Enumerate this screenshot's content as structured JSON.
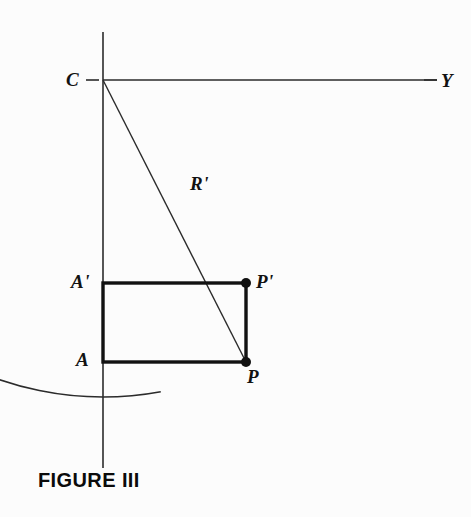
{
  "figure": {
    "caption": "FIGURE III",
    "caption_pos": {
      "x": 38,
      "y": 470
    },
    "background_color": "#fcfcfc",
    "ink_color": "#111111",
    "thin_stroke_color": "#2b2b2b"
  },
  "labels": [
    {
      "id": "center-label",
      "text": "C",
      "x": 66,
      "y": 70,
      "name": "label-c"
    },
    {
      "id": "y-label",
      "text": "Y",
      "x": 441,
      "y": 71,
      "name": "label-y"
    },
    {
      "id": "radius-label",
      "text": "R'",
      "x": 190,
      "y": 174,
      "name": "label-r-prime"
    },
    {
      "id": "a-prime-label",
      "text": "A'",
      "x": 71,
      "y": 272,
      "name": "label-a-prime"
    },
    {
      "id": "p-prime-label",
      "text": "P'",
      "x": 256,
      "y": 272,
      "name": "label-p-prime"
    },
    {
      "id": "a-label",
      "text": "A",
      "x": 76,
      "y": 350,
      "name": "label-a"
    },
    {
      "id": "p-label",
      "text": "P",
      "x": 247,
      "y": 367,
      "name": "label-p"
    }
  ],
  "geometry": {
    "vertical_axis": {
      "x": 103,
      "y1": 32,
      "y2": 468
    },
    "horizontal_axis": {
      "y": 80,
      "x1": 103,
      "x2": 437
    },
    "center_point": {
      "x": 103,
      "y": 80
    },
    "tick_c": {
      "x1": 86,
      "x2": 99,
      "y": 80
    },
    "tick_y": {
      "x1": 424,
      "x2": 437,
      "y": 80
    },
    "arc": {
      "center_x": 103,
      "center_y": 80,
      "radius": 317,
      "start_angle_deg": 79.5,
      "end_angle_deg": 264.0,
      "description": "circular arc of radius R' centered at C passing through P"
    },
    "radius_line": {
      "x1": 103,
      "y1": 80,
      "x2": 246,
      "y2": 362
    },
    "rectangle": {
      "x": 103,
      "y": 283,
      "width": 143,
      "height": 79
    },
    "point_p_prime": {
      "x": 246,
      "y": 283,
      "radius": 5
    },
    "point_p": {
      "x": 246,
      "y": 362,
      "radius": 5
    }
  },
  "stroke_widths": {
    "axis": 1.6,
    "arc": 1.6,
    "radius_line": 1.4,
    "rectangle": 3.4,
    "tick": 1.6
  }
}
